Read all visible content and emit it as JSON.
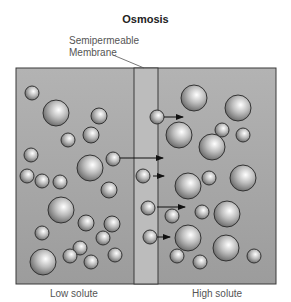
{
  "title": "Osmosis",
  "membrane_label": [
    "Semipermeable",
    "Membrane"
  ],
  "labels": {
    "left": "Low solute",
    "right": "High solute"
  },
  "colors": {
    "container": "#a6a6a6",
    "membrane": "#bcbcbc",
    "border": "#3a3a3a",
    "arrow": "#111111"
  },
  "diagram": {
    "box": {
      "x": 16,
      "y": 68,
      "w": 260,
      "h": 216
    },
    "membrane": {
      "x": 134,
      "w": 24
    },
    "left_molecules": [
      [
        32,
        93,
        7
      ],
      [
        56,
        113,
        13
      ],
      [
        99,
        116,
        8
      ],
      [
        68,
        140,
        7
      ],
      [
        91,
        135,
        8
      ],
      [
        31,
        155,
        7
      ],
      [
        90,
        168,
        13
      ],
      [
        27,
        176,
        7
      ],
      [
        42,
        181,
        7
      ],
      [
        60,
        182,
        7
      ],
      [
        113,
        159,
        7
      ],
      [
        109,
        190,
        8
      ],
      [
        61,
        210,
        13
      ],
      [
        86,
        223,
        8
      ],
      [
        112,
        224,
        8
      ],
      [
        42,
        233,
        7
      ],
      [
        103,
        238,
        7
      ],
      [
        80,
        248,
        7
      ],
      [
        43,
        262,
        13
      ],
      [
        70,
        256,
        7
      ],
      [
        91,
        262,
        7
      ],
      [
        115,
        255,
        7
      ]
    ],
    "right_molecules": [
      [
        194,
        98,
        13
      ],
      [
        238,
        108,
        13
      ],
      [
        179,
        135,
        13
      ],
      [
        222,
        130,
        7
      ],
      [
        243,
        135,
        7
      ],
      [
        212,
        147,
        13
      ],
      [
        157,
        117,
        7
      ],
      [
        143,
        176,
        7
      ],
      [
        188,
        186,
        13
      ],
      [
        209,
        178,
        7
      ],
      [
        243,
        178,
        13
      ],
      [
        148,
        208,
        7
      ],
      [
        172,
        216,
        7
      ],
      [
        188,
        238,
        13
      ],
      [
        202,
        212,
        7
      ],
      [
        227,
        214,
        13
      ],
      [
        150,
        237,
        7
      ],
      [
        177,
        256,
        7
      ],
      [
        200,
        262,
        7
      ],
      [
        226,
        248,
        13
      ],
      [
        254,
        256,
        7
      ]
    ],
    "arrows": [
      [
        164,
        117,
        183
      ],
      [
        120,
        158,
        163
      ],
      [
        153,
        176,
        164
      ],
      [
        157,
        207,
        185
      ],
      [
        157,
        237,
        170
      ]
    ]
  }
}
